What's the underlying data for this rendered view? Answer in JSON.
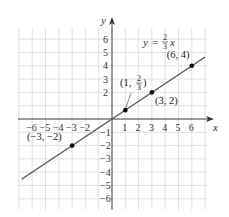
{
  "chart_data": {
    "type": "line",
    "title": "",
    "equation": "y = (2/3)x",
    "equation_parts": {
      "lhs": "y",
      "eq": "=",
      "num": "2",
      "den": "3",
      "var": "x"
    },
    "xlabel": "x",
    "ylabel": "y",
    "xlim": [
      -7,
      7
    ],
    "ylim": [
      -7,
      7
    ],
    "grid": true,
    "x_ticks": [
      -6,
      -5,
      -4,
      -3,
      -2,
      1,
      2,
      3,
      4,
      5,
      6
    ],
    "x_tick_labels": [
      "−6",
      "−5",
      "−4",
      "−3",
      "−2",
      "1",
      "2",
      "3",
      "4",
      "5",
      "6"
    ],
    "y_ticks": [
      6,
      5,
      4,
      3,
      2,
      -1,
      -2,
      -3,
      -4,
      -5,
      -6
    ],
    "y_tick_labels": [
      "6",
      "5",
      "4",
      "3",
      "2",
      "−1",
      "−2",
      "−3",
      "−4",
      "−5",
      "−6"
    ],
    "series": [
      {
        "name": "y = 2/3 x",
        "slope": 0.6667,
        "intercept": 0,
        "x_range": [
          -6.8,
          7
        ],
        "color": "#555555"
      }
    ],
    "points": [
      {
        "x": 6,
        "y": 4,
        "label": "(6, 4)"
      },
      {
        "x": 3,
        "y": 2,
        "label": "(3, 2)"
      },
      {
        "x": 1,
        "y": 0.6667,
        "label": "(1, 2/3)",
        "label_parts": {
          "open": "(1, ",
          "num": "2",
          "den": "3",
          "close": ")"
        }
      },
      {
        "x": -3,
        "y": -2,
        "label": "(−3, −2)"
      }
    ]
  }
}
